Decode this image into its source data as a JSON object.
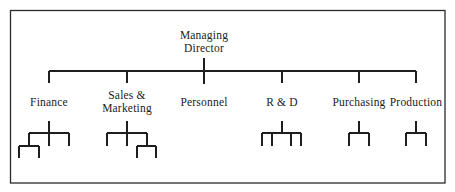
{
  "diagram": {
    "type": "organisation-chart",
    "root": {
      "label_line1": "Managing",
      "label_line2": "Director"
    },
    "departments": [
      {
        "id": "finance",
        "label_line1": "Finance",
        "label_line2": "",
        "x": 49
      },
      {
        "id": "sales-marketing",
        "label_line1": "Sales &",
        "label_line2": "Marketing",
        "x": 127
      },
      {
        "id": "personnel",
        "label_line1": "Personnel",
        "label_line2": "",
        "x": 204
      },
      {
        "id": "r-and-d",
        "label_line1": "R & D",
        "label_line2": "",
        "x": 282
      },
      {
        "id": "purchasing",
        "label_line1": "Purchasing",
        "label_line2": "",
        "x": 359
      },
      {
        "id": "production",
        "label_line1": "Production",
        "label_line2": "",
        "x": 416
      }
    ],
    "colors": {
      "line": "#1e1e1e",
      "text": "#222222",
      "background": "#ffffff"
    }
  }
}
